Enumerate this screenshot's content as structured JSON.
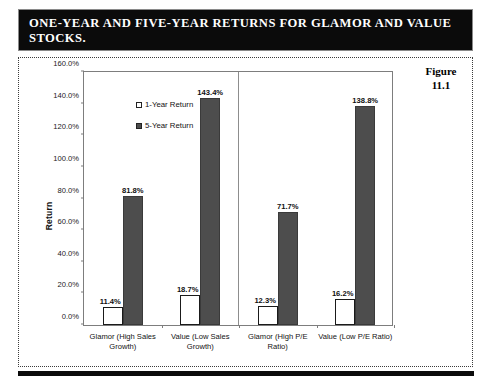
{
  "title": {
    "line1": "ONE-YEAR AND FIVE-YEAR RETURNS FOR GLAMOR AND",
    "line2": "VALUE STOCKS.",
    "full": "ONE-YEAR AND FIVE-YEAR RETURNS FOR GLAMOR AND VALUE STOCKS."
  },
  "figure": {
    "label": "Figure",
    "number": "11.1"
  },
  "colors": {
    "title_background": "#0b0b0b",
    "title_text": "#ffffff",
    "one_year_fill": "#ffffff",
    "one_year_stroke": "#1a1a1a",
    "five_year_fill": "#4d4d4d",
    "five_year_stroke": "#3a3a3a",
    "axis": "#7d7d7d",
    "plot_background": "#ffffff"
  },
  "chart_data": {
    "type": "bar",
    "title": "ONE-YEAR AND FIVE-YEAR RETURNS FOR GLAMOR AND VALUE STOCKS.",
    "xlabel": "",
    "ylabel": "Return",
    "ylim": [
      0,
      160
    ],
    "ytick_labels": [
      "0.0%",
      "20.0%",
      "40.0%",
      "60.0%",
      "80.0%",
      "100.0%",
      "120.0%",
      "140.0%",
      "160.0%"
    ],
    "ytick_values": [
      0,
      20,
      40,
      60,
      80,
      100,
      120,
      140,
      160
    ],
    "grid": false,
    "legend_position": "upper-left-inside",
    "categories": [
      "Glamor (High Sales Growth)",
      "Value (Low Sales Growth)",
      "Glamor (High P/E Ratio)",
      "Value (Low P/E Ratio)"
    ],
    "series": [
      {
        "name": "1-Year Return",
        "values": [
          11.4,
          18.7,
          12.3,
          16.2
        ],
        "value_labels": [
          "11.4%",
          "18.7%",
          "12.3%",
          "16.2%"
        ]
      },
      {
        "name": "5-Year Return",
        "values": [
          81.8,
          143.4,
          71.7,
          138.8
        ],
        "value_labels": [
          "81.8%",
          "143.4%",
          "71.7%",
          "138.8%"
        ]
      }
    ],
    "group_divider_after_category_index": 1
  }
}
